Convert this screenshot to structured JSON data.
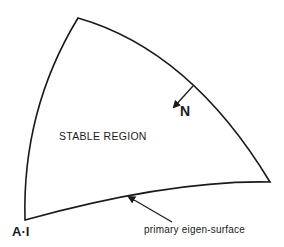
{
  "diagram": {
    "region_label": "STABLE REGION",
    "normal_label": "N",
    "vertex_label": "A·I",
    "surface_label": "primary eigen-surface",
    "colors": {
      "stroke": "#1a1a1a",
      "background": "#ffffff"
    }
  }
}
